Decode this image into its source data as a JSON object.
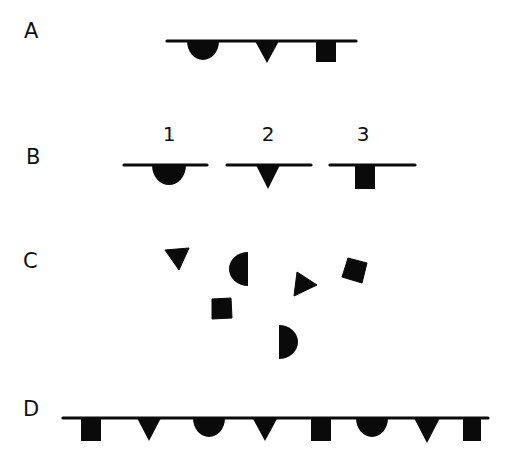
{
  "colors": {
    "ink": "#0a0a0a",
    "background": "#ffffff"
  },
  "rows": [
    {
      "id": "A",
      "label": "A",
      "label_pos": {
        "x": 24,
        "y": 21
      },
      "lines": [
        {
          "x1": 167,
          "x2": 356,
          "y": 41
        }
      ],
      "shapes": [
        {
          "type": "half-circle-down",
          "cx": 203,
          "y": 41,
          "r": 16
        },
        {
          "type": "triangle-down",
          "cx": 267,
          "y": 41,
          "w": 24,
          "h": 22
        },
        {
          "type": "square-hanging",
          "x": 316,
          "y": 41,
          "w": 20,
          "h": 21
        }
      ]
    },
    {
      "id": "B",
      "label": "B",
      "label_pos": {
        "x": 26,
        "y": 147
      },
      "numbers": [
        {
          "text": "1",
          "x": 169,
          "y": 124
        },
        {
          "text": "2",
          "x": 268,
          "y": 124
        },
        {
          "text": "3",
          "x": 363,
          "y": 124
        }
      ],
      "lines": [
        {
          "x1": 124,
          "x2": 207,
          "y": 165
        },
        {
          "x1": 227,
          "x2": 311,
          "y": 165
        },
        {
          "x1": 330,
          "x2": 415,
          "y": 165
        }
      ],
      "shapes": [
        {
          "type": "half-circle-down",
          "cx": 169,
          "y": 165,
          "r": 17
        },
        {
          "type": "triangle-down",
          "cx": 268,
          "y": 165,
          "w": 24,
          "h": 24
        },
        {
          "type": "square-hanging",
          "x": 355,
          "y": 165,
          "w": 20,
          "h": 24
        }
      ]
    },
    {
      "id": "C",
      "label": "C",
      "label_pos": {
        "x": 23,
        "y": 251
      },
      "lines": [],
      "shapes": [
        {
          "type": "polygon",
          "points": "165,250 189,248 179,270"
        },
        {
          "type": "half-circle-left",
          "flat_x": 248,
          "cy": 269,
          "r": 17
        },
        {
          "type": "polygon",
          "points": "212,299 231,298 232,318 212,319"
        },
        {
          "type": "polygon",
          "points": "297,272 317,285 294,296"
        },
        {
          "type": "polygon",
          "points": "348,258 367,263 362,283 342,277"
        },
        {
          "type": "half-circle-right",
          "flat_x": 279,
          "cy": 342,
          "r": 17
        }
      ]
    },
    {
      "id": "D",
      "label": "D",
      "label_pos": {
        "x": 23,
        "y": 399
      },
      "lines": [
        {
          "x1": 63,
          "x2": 488,
          "y": 418
        }
      ],
      "shapes": [
        {
          "type": "square-hanging",
          "x": 81,
          "y": 418,
          "w": 20,
          "h": 23
        },
        {
          "type": "triangle-down",
          "cx": 149,
          "y": 418,
          "w": 24,
          "h": 23
        },
        {
          "type": "half-circle-down",
          "cx": 209,
          "y": 418,
          "r": 16
        },
        {
          "type": "triangle-down",
          "cx": 265,
          "y": 418,
          "w": 25,
          "h": 23
        },
        {
          "type": "square-hanging",
          "x": 311,
          "y": 418,
          "w": 20,
          "h": 23
        },
        {
          "type": "half-circle-down",
          "cx": 372,
          "y": 418,
          "r": 16
        },
        {
          "type": "triangle-down",
          "cx": 427,
          "y": 418,
          "w": 26,
          "h": 25
        },
        {
          "type": "square-hanging",
          "x": 463,
          "y": 418,
          "w": 18,
          "h": 23
        }
      ]
    }
  ]
}
